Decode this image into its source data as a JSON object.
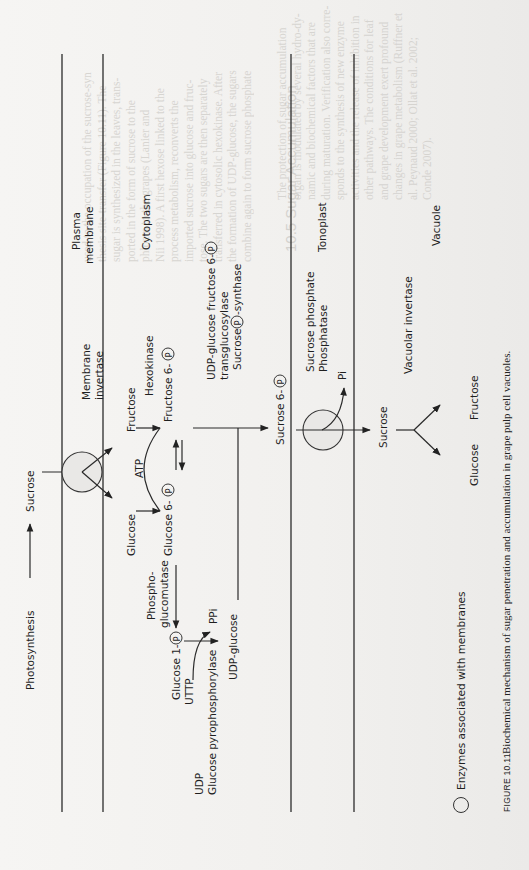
{
  "figure": {
    "number": "FIGURE 10.11",
    "caption": "Biochemical mechanism of sugar penetration and accumulation in grape pulp cell vacuoles.",
    "orientation": "rotated 90° counter-clockwise"
  },
  "legend": {
    "symbol": "open-circle",
    "label": "Enzymes associated with membranes"
  },
  "compartments": {
    "plasma_membrane": "Plasma membrane",
    "plasma_membrane_line1": "Plasma",
    "plasma_membrane_line2": "membrane",
    "cytoplasm": "Cytoplasm",
    "tonoplast": "Tonoplast",
    "vacuole": "Vacuole"
  },
  "enzymes": {
    "membrane_invertase_line1": "Membrane",
    "membrane_invertase_line2": "invertase",
    "hexokinase": "Hexokinase",
    "phosphoglucomutase_line1": "Phospho-",
    "phosphoglucomutase_line2": "glucomutase",
    "udp_glucose_pyrophosphorylase_line1": "UDP",
    "udp_glucose_pyrophosphorylase_line2": "Glucose pyrophosphorylase",
    "transglucosylase_line1": "UDP-glucose fructose 6-",
    "transglucosylase_line2": "transglucosylase",
    "sucrose_p_synthase_a": "Sucrose ",
    "sucrose_p_synthase_b": "-synthase",
    "sucrose_phosphate_phosphatase_line1": "Sucrose phosphate",
    "sucrose_phosphate_phosphatase_line2": "Phosphatase",
    "vacuolar_invertase": "Vacuolar invertase"
  },
  "metabolites": {
    "photosynthesis": "Photosynthesis",
    "sucrose_apoplast": "Sucrose",
    "fructose": "Fructose",
    "glucose": "Glucose",
    "atp": "ATP",
    "fructose_6p": "Fructose 6-",
    "glucose_6p": "Glucose 6-",
    "glucose_1p": "Glucose 1-",
    "uttp": "UTTP",
    "ppi": "PPi",
    "udp_glucose": "UDP-glucose",
    "sucrose_6p": "Sucrose 6-",
    "pi": "Pi",
    "sucrose_vacuole": "Sucrose",
    "vac_glucose": "Glucose",
    "vac_fructose": "Fructose",
    "phosphate_symbol": "P"
  },
  "bleed_through": {
    "heading": "10.5  Sugar Accumulation",
    "col_left": [
      "used to the occupation of the sucrose-syn",
      "thesis site-transfer (Figure 10.11). The",
      "sugar is synthesized in the leaves, trans-",
      "ported in the form of sucrose to the",
      "phloem to the grapes (Lanier and",
      "Nii 1998). A first hexose linked to the",
      "process metabolism, reconverts the",
      "imported sucrose into glucose and fruc-",
      "tose. The two sugars are then separately",
      "transferred in cytosolic hexokinase. After",
      "the formation of UDP-glucose, the sugars",
      "combine again to form sucrose phosphate"
    ],
    "col_right": [
      "The protection of sugar accumulation",
      "organ is modulated by several hydro-dy-",
      "namic and biochemical factors that are",
      "during maturation. Verification also corre-",
      "sponds to the synthesis of new enzyme",
      "activities and the release of inhibition in",
      "other pathways. The conditions for leaf",
      "and grape development exert profound",
      "changes in grape metabolism (Ruffner et",
      "al. Peynaud 2000; Ollat et al. 2002;",
      "Conde 2007)."
    ]
  }
}
